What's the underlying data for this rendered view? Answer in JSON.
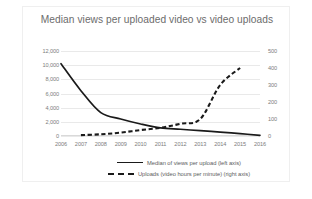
{
  "chart_data": {
    "type": "line",
    "title": "Median views per uploaded video vs video uploads",
    "xlabel": "",
    "grid": true,
    "legend_position": "bottom",
    "categories": [
      "2006",
      "2007",
      "2008",
      "2009",
      "2010",
      "2011",
      "2012",
      "2013",
      "2014",
      "2015",
      "2016"
    ],
    "axes": {
      "left": {
        "label": "Median of views per upload",
        "ylim": [
          0,
          12000
        ],
        "ticks": [
          0,
          2000,
          4000,
          6000,
          8000,
          10000,
          12000
        ],
        "tick_labels": [
          "0",
          "2,000",
          "4,000",
          "6,000",
          "8,000",
          "10,000",
          "12,000"
        ]
      },
      "right": {
        "label": "Uploads (video hours per minute)",
        "ylim": [
          0,
          500
        ],
        "ticks": [
          0,
          100,
          200,
          300,
          400,
          500
        ],
        "tick_labels": [
          "0",
          "100",
          "200",
          "300",
          "400",
          "500"
        ]
      }
    },
    "series": [
      {
        "name": "Median of views per upload (left axis)",
        "axis": "left",
        "style": "solid",
        "color": "#1a1a1a",
        "x": [
          "2006",
          "2007",
          "2008",
          "2009",
          "2010",
          "2011",
          "2012",
          "2013",
          "2014",
          "2015",
          "2016"
        ],
        "values": [
          10200,
          6400,
          3300,
          2400,
          1700,
          1150,
          950,
          750,
          550,
          330,
          100
        ]
      },
      {
        "name": "Uploads (video hours per minute) (right axis)",
        "axis": "right",
        "style": "dashed",
        "color": "#1a1a1a",
        "x": [
          "2007",
          "2008",
          "2009",
          "2010",
          "2011",
          "2012",
          "2013",
          "2014",
          "2015"
        ],
        "values": [
          5,
          10,
          20,
          35,
          48,
          72,
          100,
          300,
          400
        ]
      }
    ]
  },
  "legend": {
    "items": [
      {
        "label": "Median of views per upload (left axis)",
        "style": "solid"
      },
      {
        "label": "Uploads (video hours per minute) (right axis)",
        "style": "dashed"
      }
    ]
  }
}
